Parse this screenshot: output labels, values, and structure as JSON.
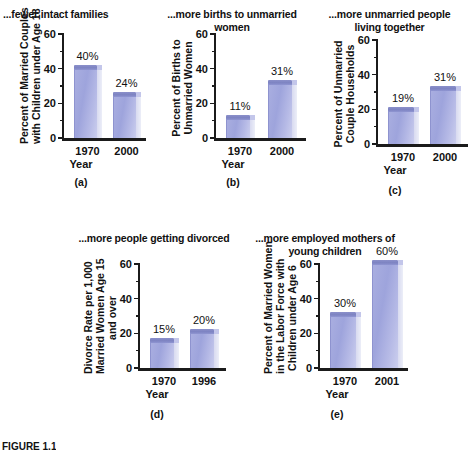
{
  "figure": {
    "caption": "FIGURE 1.1"
  },
  "chart_data": [
    {
      "id": "a",
      "type": "bar",
      "title": "...fewer intact families",
      "ylabel": "Percent of Married Couples\nwith Children under Age 18",
      "xlabel": "Year",
      "panel_label": "(a)",
      "categories": [
        "1970",
        "2000"
      ],
      "values": [
        40,
        24
      ],
      "data_labels": [
        "40%",
        "24%"
      ],
      "ylim": [
        0,
        60
      ],
      "yticks": [
        0,
        20,
        40,
        60
      ],
      "ytick_labels": [
        "0",
        "20",
        "40",
        "60"
      ],
      "minor_yticks": [
        10,
        30,
        50
      ],
      "grid": false,
      "legend": "none",
      "bar_color": "#9ea4dc"
    },
    {
      "id": "b",
      "type": "bar",
      "title": "...more births to unmarried women",
      "ylabel": "Percent of Births to\nUnmarried Women",
      "xlabel": "Year",
      "panel_label": "(b)",
      "categories": [
        "1970",
        "2000"
      ],
      "values": [
        11,
        31
      ],
      "data_labels": [
        "11%",
        "31%"
      ],
      "ylim": [
        0,
        60
      ],
      "yticks": [
        0,
        20,
        40,
        60
      ],
      "ytick_labels": [
        "0",
        "20",
        "40",
        "60"
      ],
      "minor_yticks": [
        10,
        30,
        50
      ],
      "grid": false,
      "legend": "none",
      "bar_color": "#9ea4dc"
    },
    {
      "id": "c",
      "type": "bar",
      "title": "...more unmarried people\nliving together",
      "ylabel": "Percent of Unmarried\nCouple Households",
      "xlabel": "Year",
      "panel_label": "(c)",
      "categories": [
        "1970",
        "2000"
      ],
      "values": [
        19,
        31
      ],
      "data_labels": [
        "19%",
        "31%"
      ],
      "ylim": [
        0,
        60
      ],
      "yticks": [
        0,
        20,
        40,
        60
      ],
      "ytick_labels": [
        "0",
        "20",
        "40",
        "60"
      ],
      "minor_yticks": [
        10,
        30,
        50
      ],
      "grid": false,
      "legend": "none",
      "bar_color": "#9ea4dc"
    },
    {
      "id": "d",
      "type": "bar",
      "title": "...more people getting divorced",
      "ylabel": "Divorce Rate per 1,000\nMarried Women Age 15\nand over",
      "xlabel": "Year",
      "panel_label": "(d)",
      "categories": [
        "1970",
        "1996"
      ],
      "values": [
        15,
        20
      ],
      "data_labels": [
        "15%",
        "20%"
      ],
      "ylim": [
        0,
        60
      ],
      "yticks": [
        0,
        20,
        40,
        60
      ],
      "ytick_labels": [
        "0",
        "20",
        "40",
        "60"
      ],
      "minor_yticks": [
        10,
        30,
        50
      ],
      "grid": false,
      "legend": "none",
      "bar_color": "#9ea4dc"
    },
    {
      "id": "e",
      "type": "bar",
      "title": "...more employed mothers of\nyoung children",
      "ylabel": "Percent of Married Women\nin the Labor Force with\nChildren under Age 6",
      "xlabel": "Year",
      "panel_label": "(e)",
      "categories": [
        "1970",
        "2001"
      ],
      "values": [
        30,
        60
      ],
      "data_labels": [
        "30%",
        "60%"
      ],
      "ylim": [
        0,
        60
      ],
      "yticks": [
        0,
        20,
        40,
        60
      ],
      "ytick_labels": [
        "0",
        "20",
        "40",
        "60"
      ],
      "minor_yticks": [
        10,
        30,
        50
      ],
      "grid": false,
      "legend": "none",
      "bar_color": "#9ea4dc"
    }
  ]
}
